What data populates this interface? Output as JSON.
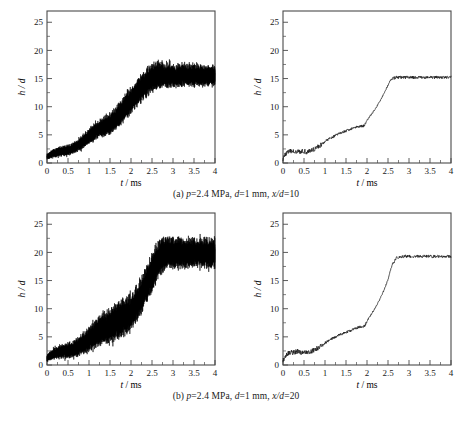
{
  "figure": {
    "panels": [
      {
        "id": "a-raw",
        "kind": "raw",
        "caption_row": "a"
      },
      {
        "id": "a-smooth",
        "kind": "smooth",
        "caption_row": "a"
      },
      {
        "id": "b-raw",
        "kind": "raw",
        "caption_row": "b"
      },
      {
        "id": "b-smooth",
        "kind": "smooth",
        "caption_row": "b"
      }
    ],
    "captions": {
      "a": "(a) p=2.4 MPa, d=1 mm, x/d=10",
      "b": "(b) p=2.4 MPa, d=1 mm, x/d=20"
    },
    "caption_parts": {
      "a": {
        "index": "(a)",
        "pressure_sym": "p",
        "pressure_val": "=2.4 MPa,",
        "diameter_sym": "d",
        "diameter_val": "=1 mm,",
        "ratio_sym": "x/d",
        "ratio_val": "=10"
      },
      "b": {
        "index": "(b)",
        "pressure_sym": "p",
        "pressure_val": "=2.4 MPa,",
        "diameter_sym": "d",
        "diameter_val": "=1 mm,",
        "ratio_sym": "x/d",
        "ratio_val": "=20"
      }
    },
    "colors": {
      "trace": "#000000",
      "axis": "#4a4a4a",
      "background": "#ffffff",
      "text": "#1a1a1a"
    }
  },
  "chart_data": [
    {
      "type": "line",
      "id": "a-raw",
      "title": "",
      "xlabel": "t / ms",
      "ylabel": "h / d",
      "xlabel_parts": {
        "sym": "t",
        "unit": "/ ms"
      },
      "ylabel_parts": {
        "num": "h",
        "den": "/ d"
      },
      "xlim": [
        0,
        4
      ],
      "ylim": [
        0,
        27
      ],
      "xticks": [
        0,
        0.5,
        1,
        1.5,
        2,
        2.5,
        3,
        3.5,
        4
      ],
      "xticklabels": [
        "0",
        "0.5",
        "1",
        "1.5",
        "2",
        "2.5",
        "3",
        "3.5",
        "4"
      ],
      "yticks": [
        0,
        5,
        10,
        15,
        20,
        25
      ],
      "yticklabels": [
        "0",
        "5",
        "10",
        "15",
        "20",
        "25"
      ],
      "x_minor_per_major": 2,
      "y_minor_per_major": 2,
      "grid": false,
      "legend": null,
      "series": [
        {
          "name": "h/d raw signal",
          "note": "high-frequency noisy band; mean trend with growing half-width",
          "x": [
            0,
            0.1,
            0.2,
            0.3,
            0.4,
            0.5,
            0.6,
            0.7,
            0.8,
            0.9,
            1.0,
            1.1,
            1.2,
            1.3,
            1.4,
            1.5,
            1.6,
            1.7,
            1.8,
            1.9,
            2.0,
            2.1,
            2.2,
            2.3,
            2.4,
            2.5,
            2.6,
            2.7,
            2.8,
            2.9,
            3.0,
            3.2,
            3.4,
            3.6,
            3.8,
            4.0
          ],
          "mean": [
            1.1,
            1.5,
            1.8,
            2.0,
            2.1,
            2.2,
            2.5,
            2.9,
            3.4,
            4.0,
            4.7,
            5.3,
            5.8,
            6.2,
            6.6,
            7.0,
            7.5,
            8.3,
            9.2,
            10.1,
            11.0,
            11.9,
            12.8,
            13.6,
            14.4,
            15.0,
            15.4,
            15.5,
            15.5,
            15.5,
            15.5,
            15.5,
            15.5,
            15.5,
            15.5,
            15.5
          ],
          "halfwidth": [
            0.5,
            0.7,
            0.8,
            0.9,
            0.9,
            1.0,
            1.0,
            1.1,
            1.2,
            1.3,
            1.4,
            1.5,
            1.6,
            1.7,
            1.8,
            1.9,
            2.0,
            2.1,
            2.2,
            2.3,
            2.4,
            2.4,
            2.5,
            2.5,
            2.6,
            2.6,
            2.5,
            2.4,
            2.3,
            2.2,
            2.1,
            2.0,
            2.0,
            1.9,
            1.9,
            1.9
          ]
        }
      ]
    },
    {
      "type": "line",
      "id": "a-smooth",
      "title": "",
      "xlabel": "t / ms",
      "ylabel": "h / d",
      "xlabel_parts": {
        "sym": "t",
        "unit": "/ ms"
      },
      "ylabel_parts": {
        "num": "h",
        "den": "/ d"
      },
      "xlim": [
        0,
        4
      ],
      "ylim": [
        0,
        27
      ],
      "xticks": [
        0,
        0.5,
        1,
        1.5,
        2,
        2.5,
        3,
        3.5,
        4
      ],
      "xticklabels": [
        "0",
        "0.5",
        "1",
        "1.5",
        "2",
        "2.5",
        "3",
        "3.5",
        "4"
      ],
      "yticks": [
        0,
        5,
        10,
        15,
        20,
        25
      ],
      "yticklabels": [
        "0",
        "5",
        "10",
        "15",
        "20",
        "25"
      ],
      "x_minor_per_major": 2,
      "y_minor_per_major": 2,
      "grid": false,
      "legend": null,
      "series": [
        {
          "name": "h/d mean trace",
          "note": "smoothed mean penetration; slight jitter retained",
          "x": [
            0,
            0.05,
            0.1,
            0.15,
            0.2,
            0.25,
            0.3,
            0.35,
            0.4,
            0.45,
            0.5,
            0.55,
            0.6,
            0.65,
            0.7,
            0.75,
            0.8,
            0.85,
            0.9,
            0.95,
            1.0,
            1.1,
            1.2,
            1.3,
            1.4,
            1.5,
            1.6,
            1.7,
            1.8,
            1.85,
            1.9,
            1.95,
            2.0,
            2.1,
            2.2,
            2.3,
            2.4,
            2.5,
            2.55,
            2.6,
            2.7,
            2.8,
            3.0,
            3.2,
            3.4,
            3.6,
            3.8,
            4.0
          ],
          "y": [
            0.8,
            1.5,
            1.9,
            2.0,
            2.1,
            2.0,
            2.1,
            2.2,
            2.1,
            2.0,
            2.1,
            2.0,
            2.1,
            2.2,
            2.3,
            2.5,
            2.7,
            3.0,
            3.2,
            3.5,
            3.8,
            4.3,
            4.7,
            5.1,
            5.4,
            5.7,
            6.0,
            6.3,
            6.5,
            6.6,
            6.5,
            6.8,
            7.6,
            8.6,
            9.6,
            10.9,
            12.3,
            13.8,
            14.6,
            15.0,
            15.2,
            15.2,
            15.2,
            15.2,
            15.2,
            15.2,
            15.2,
            15.2
          ]
        }
      ]
    },
    {
      "type": "line",
      "id": "b-raw",
      "title": "",
      "xlabel": "t / ms",
      "ylabel": "h / d",
      "xlabel_parts": {
        "sym": "t",
        "unit": "/ ms"
      },
      "ylabel_parts": {
        "num": "h",
        "den": "/ d"
      },
      "xlim": [
        0,
        4
      ],
      "ylim": [
        0,
        27
      ],
      "xticks": [
        0,
        0.5,
        1,
        1.5,
        2,
        2.5,
        3,
        3.5,
        4
      ],
      "xticklabels": [
        "0",
        "0.5",
        "1",
        "1.5",
        "2",
        "2.5",
        "3",
        "3.5",
        "4"
      ],
      "yticks": [
        0,
        5,
        10,
        15,
        20,
        25
      ],
      "yticklabels": [
        "0",
        "5",
        "10",
        "15",
        "20",
        "25"
      ],
      "x_minor_per_major": 2,
      "y_minor_per_major": 2,
      "grid": false,
      "legend": null,
      "series": [
        {
          "name": "h/d raw signal",
          "note": "noisy band reaching higher plateau near 20",
          "x": [
            0,
            0.1,
            0.2,
            0.3,
            0.4,
            0.5,
            0.6,
            0.7,
            0.8,
            0.9,
            1.0,
            1.1,
            1.2,
            1.3,
            1.4,
            1.5,
            1.6,
            1.7,
            1.8,
            1.9,
            2.0,
            2.1,
            2.2,
            2.3,
            2.4,
            2.5,
            2.6,
            2.7,
            2.8,
            2.9,
            3.0,
            3.2,
            3.4,
            3.6,
            3.8,
            4.0
          ],
          "mean": [
            1.2,
            1.7,
            2.1,
            2.3,
            2.4,
            2.5,
            2.7,
            3.0,
            3.4,
            3.9,
            4.5,
            5.1,
            5.7,
            6.2,
            6.6,
            7.0,
            7.4,
            7.8,
            8.2,
            8.6,
            9.2,
            10.3,
            11.6,
            13.0,
            14.6,
            16.3,
            18.0,
            19.2,
            19.7,
            19.8,
            19.8,
            19.8,
            19.8,
            19.8,
            19.8,
            19.8
          ],
          "halfwidth": [
            0.6,
            0.9,
            1.1,
            1.2,
            1.3,
            1.4,
            1.5,
            1.6,
            1.8,
            2.0,
            2.2,
            2.4,
            2.6,
            2.8,
            3.0,
            3.2,
            3.3,
            3.4,
            3.4,
            3.4,
            3.3,
            3.3,
            3.3,
            3.3,
            3.4,
            3.5,
            3.4,
            3.2,
            3.0,
            2.9,
            2.8,
            2.7,
            2.7,
            2.7,
            2.7,
            2.7
          ]
        }
      ]
    },
    {
      "type": "line",
      "id": "b-smooth",
      "title": "",
      "xlabel": "t / ms",
      "ylabel": "h / d",
      "xlabel_parts": {
        "sym": "t",
        "unit": "/ ms"
      },
      "ylabel_parts": {
        "num": "h",
        "den": "/ d"
      },
      "xlim": [
        0,
        4
      ],
      "ylim": [
        0,
        27
      ],
      "xticks": [
        0,
        0.5,
        1,
        1.5,
        2,
        2.5,
        3,
        3.5,
        4
      ],
      "xticklabels": [
        "0",
        "0.5",
        "1",
        "1.5",
        "2",
        "2.5",
        "3",
        "3.5",
        "4"
      ],
      "yticks": [
        0,
        5,
        10,
        15,
        20,
        25
      ],
      "yticklabels": [
        "0",
        "5",
        "10",
        "15",
        "20",
        "25"
      ],
      "x_minor_per_major": 2,
      "y_minor_per_major": 2,
      "grid": false,
      "legend": null,
      "series": [
        {
          "name": "h/d mean trace",
          "note": "smoothed mean penetration rising to plateau ~19.3",
          "x": [
            0,
            0.05,
            0.1,
            0.15,
            0.2,
            0.25,
            0.3,
            0.35,
            0.4,
            0.45,
            0.5,
            0.55,
            0.6,
            0.65,
            0.7,
            0.75,
            0.8,
            0.85,
            0.9,
            0.95,
            1.0,
            1.1,
            1.2,
            1.3,
            1.4,
            1.5,
            1.6,
            1.7,
            1.8,
            1.85,
            1.9,
            1.95,
            2.0,
            2.1,
            2.2,
            2.3,
            2.4,
            2.5,
            2.55,
            2.6,
            2.7,
            2.8,
            3.0,
            3.2,
            3.4,
            3.6,
            3.8,
            4.0
          ],
          "y": [
            0.8,
            1.5,
            2.0,
            2.2,
            2.3,
            2.2,
            2.3,
            2.4,
            2.3,
            2.2,
            2.3,
            2.2,
            2.3,
            2.4,
            2.5,
            2.7,
            2.9,
            3.1,
            3.4,
            3.6,
            3.9,
            4.4,
            4.8,
            5.2,
            5.5,
            5.8,
            6.1,
            6.4,
            6.7,
            6.8,
            6.7,
            7.0,
            7.8,
            9.0,
            10.2,
            11.6,
            13.2,
            15.2,
            16.6,
            17.8,
            19.0,
            19.3,
            19.3,
            19.3,
            19.3,
            19.3,
            19.3,
            19.3
          ]
        }
      ]
    }
  ]
}
